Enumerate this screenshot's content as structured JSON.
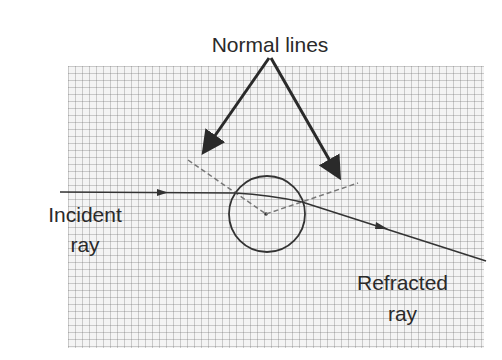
{
  "title": "Normal lines",
  "labels": {
    "normal_lines": "Normal lines",
    "incident_line1": "Incident",
    "incident_line2": "ray",
    "refracted_line1": "Refracted",
    "refracted_line2": "ray"
  },
  "colors": {
    "ink": "#2a2a2a",
    "grid": "#9a9a9a",
    "dashed": "#777777"
  }
}
